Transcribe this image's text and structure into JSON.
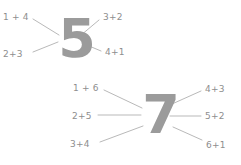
{
  "page": {
    "background_color": "#ffffff",
    "numeral_color": "#9b9b9b",
    "label_color": "#8e8e8e",
    "line_color": "#b9b9b9"
  },
  "diagrams": [
    {
      "id": "burst-5",
      "name": "number-bond-5",
      "sum": "5",
      "numeral_font_size": 54,
      "numeral_left": 56,
      "numeral_top": 12,
      "numeral_width": 42,
      "origin_x": 76,
      "origin_y": 40,
      "labels": [
        {
          "text": "1 + 4",
          "name": "addend-pair-1-plus-4",
          "x": 3,
          "y": 13,
          "align": "align-left",
          "line": {
            "x1": 33,
            "y1": 19,
            "x2": 59,
            "y2": 35
          }
        },
        {
          "text": "3+2",
          "name": "addend-pair-3-plus-2",
          "x": 103,
          "y": 13,
          "align": "align-left",
          "line": {
            "x1": 99,
            "y1": 20,
            "x2": 80,
            "y2": 36
          }
        },
        {
          "text": "2+3",
          "name": "addend-pair-2-plus-3",
          "x": 3,
          "y": 50,
          "align": "align-left",
          "line": {
            "x1": 33,
            "y1": 52,
            "x2": 58,
            "y2": 42
          }
        },
        {
          "text": "4+1",
          "name": "addend-pair-4-plus-1",
          "x": 105,
          "y": 48,
          "align": "align-left",
          "line": {
            "x1": 101,
            "y1": 51,
            "x2": 82,
            "y2": 43
          }
        }
      ]
    },
    {
      "id": "burst-7",
      "name": "number-bond-7",
      "sum": "7",
      "numeral_font_size": 54,
      "numeral_left": 140,
      "numeral_top": 88,
      "numeral_width": 42,
      "origin_x": 160,
      "origin_y": 116,
      "labels": [
        {
          "text": "1 + 6",
          "name": "addend-pair-1-plus-6",
          "x": 73,
          "y": 84,
          "align": "align-left",
          "line": {
            "x1": 104,
            "y1": 90,
            "x2": 142,
            "y2": 108
          }
        },
        {
          "text": "4+3",
          "name": "addend-pair-4-plus-3",
          "x": 205,
          "y": 85,
          "align": "align-left",
          "line": {
            "x1": 201,
            "y1": 91,
            "x2": 172,
            "y2": 104
          }
        },
        {
          "text": "2+5",
          "name": "addend-pair-2-plus-5",
          "x": 72,
          "y": 112,
          "align": "align-left",
          "line": {
            "x1": 98,
            "y1": 115,
            "x2": 141,
            "y2": 115
          }
        },
        {
          "text": "5+2",
          "name": "addend-pair-5-plus-2",
          "x": 205,
          "y": 112,
          "align": "align-left",
          "line": {
            "x1": 201,
            "y1": 116,
            "x2": 170,
            "y2": 116
          }
        },
        {
          "text": "3+4",
          "name": "addend-pair-3-plus-4",
          "x": 70,
          "y": 140,
          "align": "align-left",
          "line": {
            "x1": 100,
            "y1": 142,
            "x2": 143,
            "y2": 126
          }
        },
        {
          "text": "6+1",
          "name": "addend-pair-6-plus-1",
          "x": 206,
          "y": 141,
          "align": "align-left",
          "line": {
            "x1": 202,
            "y1": 140,
            "x2": 173,
            "y2": 127
          }
        }
      ]
    }
  ]
}
